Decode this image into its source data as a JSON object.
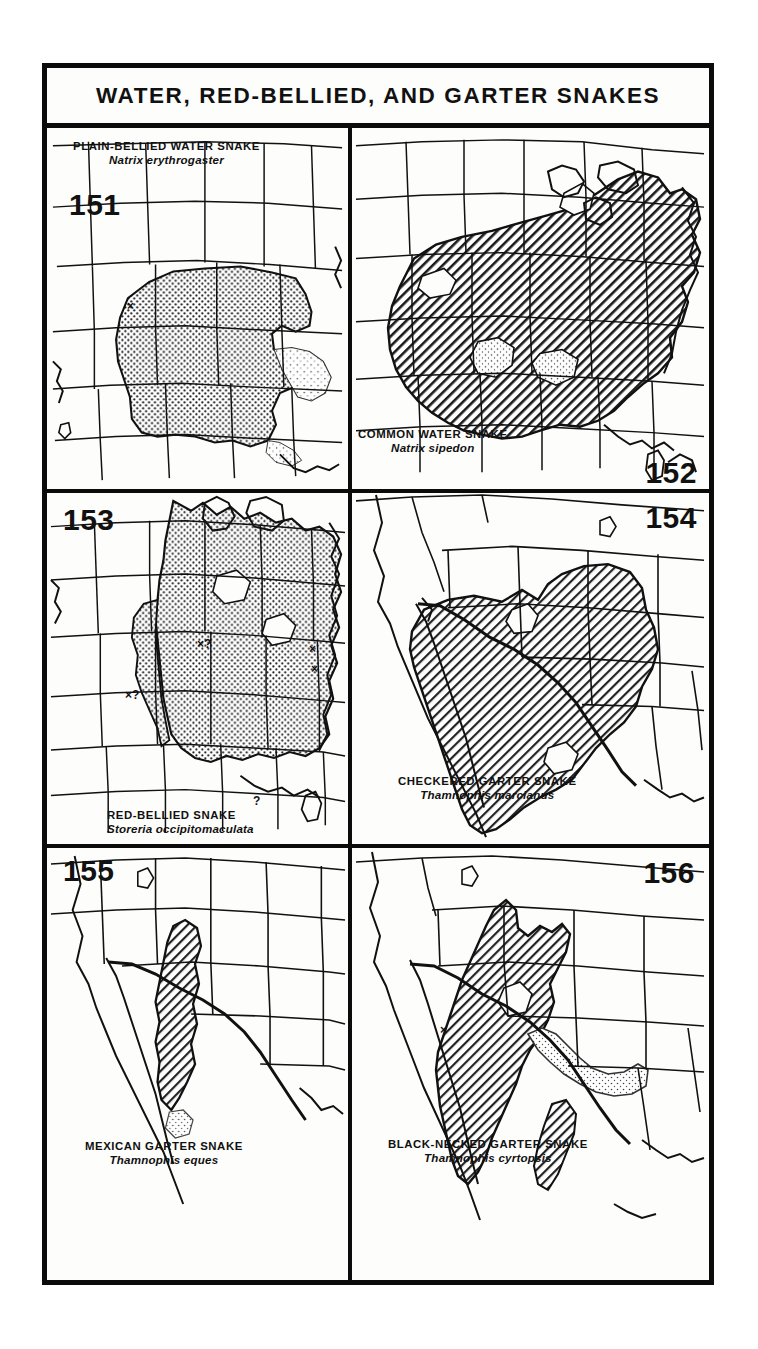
{
  "page": {
    "title": "WATER, RED-BELLIED, AND GARTER SNAKES",
    "background_color": "#ffffff",
    "ink_color": "#0b0b0b"
  },
  "plate": {
    "header": "WATER, RED-BELLIED, AND GARTER SNAKES"
  },
  "maps": [
    {
      "number": "151",
      "common_name": "PLAIN-BELLIED WATER SNAKE",
      "scientific_name": "Natrix erythrogaster",
      "range_fill": "stipple",
      "region": "central and southeastern United States",
      "markers": [
        "×"
      ]
    },
    {
      "number": "152",
      "common_name": "COMMON WATER SNAKE",
      "scientific_name": "Natrix sipedon",
      "range_fill": "diagonal-hatch",
      "region": "eastern United States",
      "markers": []
    },
    {
      "number": "153",
      "common_name": "RED-BELLIED SNAKE",
      "scientific_name": "Storeria occipitomaculata",
      "range_fill": "stipple",
      "region": "eastern and north-central United States",
      "markers": [
        "×?",
        "×?",
        "×",
        "×",
        "?"
      ]
    },
    {
      "number": "154",
      "common_name": "CHECKERED GARTER SNAKE",
      "scientific_name": "Thamnophis marcianus",
      "range_fill": "diagonal-hatch",
      "region": "south-central United States and northern Mexico",
      "markers": []
    },
    {
      "number": "155",
      "common_name": "MEXICAN GARTER SNAKE",
      "scientific_name": "Thamnophis eques",
      "range_fill": "diagonal-hatch",
      "region": "southeastern Arizona and northern Mexico",
      "markers": []
    },
    {
      "number": "156",
      "common_name": "BLACK-NECKED GARTER SNAKE",
      "scientific_name": "Thamnophis cyrtopsis",
      "range_fill": "diagonal-hatch",
      "region": "southwestern United States and Mexico",
      "markers": [
        "×"
      ]
    }
  ],
  "markers": {
    "x": "×",
    "x_query": "×?",
    "query": "?"
  }
}
